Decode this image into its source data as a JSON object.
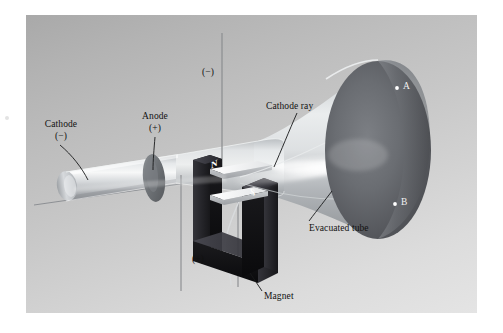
{
  "figure": {
    "panel_background_top": "#a9a9a9",
    "panel_background_bottom": "#e4e4e4"
  },
  "labels": {
    "cathode": {
      "name": "Cathode",
      "sign": "(−)"
    },
    "anode": {
      "name": "Anode",
      "sign": "(+)"
    },
    "cathode_ray": {
      "name": "Cathode ray"
    },
    "evacuated_tube": {
      "name": "Evacuated tube"
    },
    "magnet": {
      "name": "Magnet"
    },
    "plate_negative": {
      "sign": "(−)"
    },
    "plate_positive": {
      "sign": "(+)"
    },
    "north_pole": {
      "text": "N"
    },
    "south_pole": {
      "text": "S"
    },
    "spot_a": {
      "text": "A"
    },
    "spot_b": {
      "text": "B"
    }
  },
  "colors": {
    "glass": "#c9cdd0",
    "glass_highlight": "#f2f4f5",
    "screen_dark": "#5a5c60",
    "magnet_body": "#0d0d0f",
    "plate_white": "#f4f5f6",
    "ray_glow": "#ffffff",
    "wire": "#8e9092",
    "label_text": "#111111",
    "spot_text": "#f2f2f2"
  }
}
